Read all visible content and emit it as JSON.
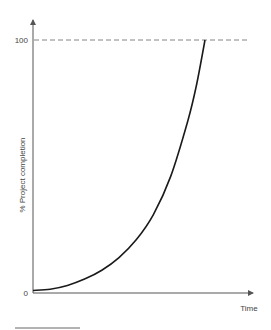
{
  "chart_data": {
    "type": "line",
    "title": "",
    "xlabel": "Time",
    "ylabel": "% Project completion",
    "ylim": [
      0,
      100
    ],
    "xlim": [
      0,
      1
    ],
    "y_ticks": [
      {
        "value": 0,
        "label": "0"
      },
      {
        "value": 100,
        "label": "100"
      }
    ],
    "reference_lines": [
      {
        "orientation": "horizontal",
        "value": 100,
        "style": "dashed"
      }
    ],
    "series": [
      {
        "name": "completion",
        "description": "exponential growth curve from ~1% at start to 100%",
        "x": [
          0,
          0.1,
          0.2,
          0.3,
          0.4,
          0.5,
          0.6,
          0.7,
          0.8,
          0.9,
          0.95,
          1.0
        ],
        "y": [
          1,
          1.5,
          3,
          5.5,
          9,
          14,
          21,
          31,
          46,
          68,
          82,
          100
        ]
      }
    ],
    "grid": false,
    "legend": "none"
  },
  "colors": {
    "axis": "#555555",
    "curve": "#1a1a1a",
    "dash": "#666666"
  }
}
